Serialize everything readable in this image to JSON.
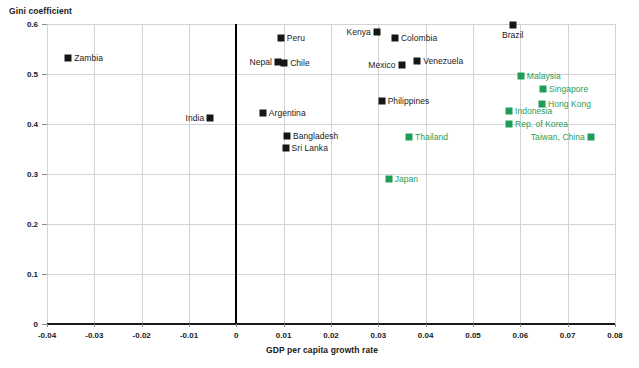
{
  "chart_data": {
    "type": "scatter",
    "title": "",
    "ylabel": "Gini coefficient",
    "xlabel": "GDP per capita growth rate",
    "xlim": [
      -0.04,
      0.08
    ],
    "ylim": [
      0.0,
      0.6
    ],
    "xticks": [
      "-0.04",
      "-0.03",
      "-0.02",
      "-0.01",
      "0",
      "0.01",
      "0.02",
      "0.03",
      "0.04",
      "0.05",
      "0.06",
      "0.07",
      "0.08"
    ],
    "xtick_values": [
      -0.04,
      -0.03,
      -0.02,
      -0.01,
      0,
      0.01,
      0.02,
      0.03,
      0.04,
      0.05,
      0.06,
      0.07,
      0.08
    ],
    "yticks": [
      "0",
      "0.1",
      "0.2",
      "0.3",
      "0.4",
      "0.5",
      "0.6"
    ],
    "ytick_values": [
      0,
      0.1,
      0.2,
      0.3,
      0.4,
      0.5,
      0.6
    ],
    "grid": true,
    "legend": "none",
    "zero_reference_line_x": 0,
    "series": [
      {
        "name": "other-economies",
        "color": "#161616",
        "points": [
          {
            "label": "Zambia",
            "x": -0.0355,
            "y": 0.533,
            "label_pos": "right"
          },
          {
            "label": "India",
            "x": -0.0055,
            "y": 0.413,
            "label_pos": "left"
          },
          {
            "label": "Peru",
            "x": 0.0094,
            "y": 0.573,
            "label_pos": "right"
          },
          {
            "label": "Nepal",
            "x": 0.0088,
            "y": 0.525,
            "label_pos": "left"
          },
          {
            "label": "Chile",
            "x": 0.0101,
            "y": 0.522,
            "label_pos": "right"
          },
          {
            "label": "Argentina",
            "x": 0.0056,
            "y": 0.423,
            "label_pos": "right"
          },
          {
            "label": "Bangladesh",
            "x": 0.0107,
            "y": 0.377,
            "label_pos": "right"
          },
          {
            "label": "Sri Lanka",
            "x": 0.0104,
            "y": 0.353,
            "label_pos": "right"
          },
          {
            "label": "Kenya",
            "x": 0.0297,
            "y": 0.584,
            "label_pos": "left"
          },
          {
            "label": "Colombia",
            "x": 0.0335,
            "y": 0.572,
            "label_pos": "right"
          },
          {
            "label": "Mexico",
            "x": 0.0349,
            "y": 0.519,
            "label_pos": "left"
          },
          {
            "label": "Venezuela",
            "x": 0.0382,
            "y": 0.526,
            "label_pos": "right"
          },
          {
            "label": "Philippines",
            "x": 0.0307,
            "y": 0.446,
            "label_pos": "right"
          },
          {
            "label": "Brazil",
            "x": 0.0584,
            "y": 0.598,
            "label_pos": "below"
          }
        ]
      },
      {
        "name": "east-asian-economies",
        "color": "#1f9d58",
        "points": [
          {
            "label": "Thailand",
            "x": 0.0365,
            "y": 0.374,
            "label_pos": "right"
          },
          {
            "label": "Japan",
            "x": 0.0322,
            "y": 0.29,
            "label_pos": "right"
          },
          {
            "label": "Malaysia",
            "x": 0.0601,
            "y": 0.496,
            "label_pos": "right"
          },
          {
            "label": "Singapore",
            "x": 0.0648,
            "y": 0.47,
            "label_pos": "right"
          },
          {
            "label": "Hong Kong",
            "x": 0.0646,
            "y": 0.441,
            "label_pos": "right"
          },
          {
            "label": "Indonesia",
            "x": 0.0576,
            "y": 0.426,
            "label_pos": "right"
          },
          {
            "label": "Rep. of Korea",
            "x": 0.0576,
            "y": 0.4,
            "label_pos": "right"
          },
          {
            "label": "Taiwan, China",
            "x": 0.0749,
            "y": 0.374,
            "label_pos": "left"
          }
        ]
      }
    ]
  }
}
